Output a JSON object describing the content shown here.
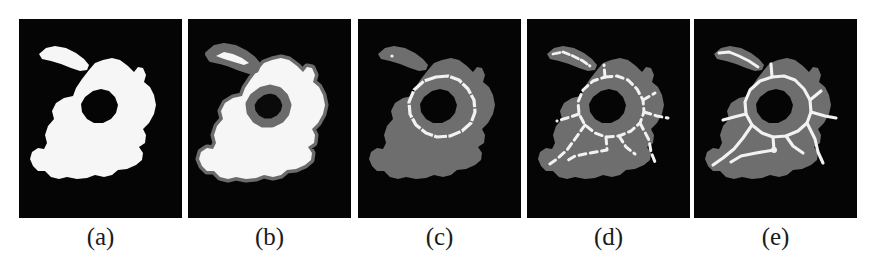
{
  "figure": {
    "panel_count": 5,
    "background_color": "#ffffff",
    "panel_background_color": "#050505",
    "foreground_white": "#f6f6f6",
    "foreground_gray": "#6e6e6e",
    "border_gray": "#5a5a5a",
    "caption_color": "#1b1b1b"
  },
  "panels": [
    {
      "caption": "(a)",
      "name": "binary-shape",
      "description": "Binary silhouette: white blob with interior hole and detached ellipse",
      "fill": "white",
      "has_outline": false,
      "has_skeleton": false
    },
    {
      "caption": "(b)",
      "name": "shape-with-gray-border",
      "description": "White blob with gray boundary band and hole",
      "fill": "white",
      "has_outline": true,
      "has_skeleton": false
    },
    {
      "caption": "(c)",
      "name": "gray-shape-with-contour",
      "description": "Gray blob with single white closed contour around hole",
      "fill": "gray",
      "has_outline": false,
      "has_skeleton": "closed-contour"
    },
    {
      "caption": "(d)",
      "name": "broken-skeleton",
      "description": "Gray blob with dotted, broken skeleton branches",
      "fill": "gray",
      "has_outline": false,
      "has_skeleton": "dotted"
    },
    {
      "caption": "(e)",
      "name": "connected-skeleton",
      "description": "Gray blob with continuous connected skeleton branches",
      "fill": "gray",
      "has_outline": false,
      "has_skeleton": "continuous"
    }
  ]
}
